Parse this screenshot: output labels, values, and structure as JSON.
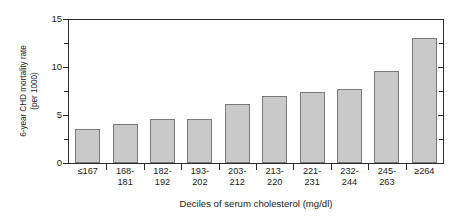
{
  "chart_data": {
    "type": "bar",
    "title": "",
    "subtitle": "",
    "xlabel": "Deciles of serum cholesterol (mg/dl)",
    "ylabel": "6-year CHD mortality rate (per 1000)",
    "ylabel_line1": "6-year CHD mortality rate",
    "ylabel_line2": "(per 1000)",
    "categories": [
      "≤167",
      "168-181",
      "182-192",
      "193-202",
      "203-212",
      "213-220",
      "221-231",
      "232-244",
      "245-263",
      "≥264"
    ],
    "category_lines": [
      [
        "≤167"
      ],
      [
        "168-",
        "181"
      ],
      [
        "182-",
        "192"
      ],
      [
        "193-",
        "202"
      ],
      [
        "203-",
        "212"
      ],
      [
        "213-",
        "220"
      ],
      [
        "221-",
        "231"
      ],
      [
        "232-",
        "244"
      ],
      [
        "245-",
        "263"
      ],
      [
        "≥264"
      ]
    ],
    "values": [
      3.5,
      4.1,
      4.6,
      4.6,
      6.1,
      7.0,
      7.4,
      7.7,
      9.6,
      13.0
    ],
    "ylim": [
      0,
      15
    ],
    "ytick_labels": [
      "0",
      "5",
      "10",
      "15"
    ],
    "ytick_values": [
      0,
      5,
      10,
      15
    ],
    "yminor_values": [
      2.5,
      7.5,
      12.5
    ],
    "grid": false,
    "legend": null,
    "bar_color": "#c9c9c9",
    "bar_edge_color": "#7a7a7a",
    "axis_color": "#2b2b2b"
  }
}
